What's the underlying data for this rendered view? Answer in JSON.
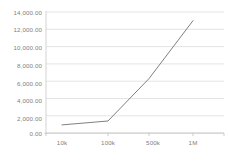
{
  "chart_data": {
    "type": "line",
    "title": "",
    "subtitle": "",
    "xlabel": "",
    "ylabel": "",
    "categories": [
      "10k",
      "100k",
      "500k",
      "1M"
    ],
    "values": [
      950,
      1400,
      6300,
      13000
    ],
    "series": [
      {
        "name": "",
        "values": [
          950,
          1400,
          6300,
          13000
        ]
      }
    ],
    "ylim": [
      0,
      14000
    ],
    "yticks": [
      0,
      2000,
      4000,
      6000,
      8000,
      10000,
      12000,
      14000
    ],
    "ytick_labels": [
      "0.00",
      "2,000.00",
      "4,000.00",
      "6,000.00",
      "8,000.00",
      "10,000.00",
      "12,000.00",
      "14,000.00"
    ],
    "xtick_labels": [
      "10k",
      "100k",
      "500k",
      "1M"
    ],
    "grid": {
      "horizontal": true,
      "vertical": false
    },
    "legend": {
      "visible": false,
      "position": "none",
      "entries": []
    },
    "colors": {
      "line": "#808080",
      "gridline": "#d9d9d9",
      "axis": "#bfbfbf",
      "tick_text": "#808080",
      "background": "#ffffff"
    },
    "line_width": 1.0,
    "markers": false
  }
}
